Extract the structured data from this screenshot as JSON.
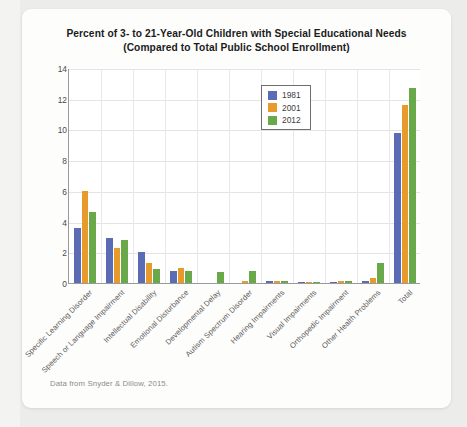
{
  "chart_data": {
    "type": "bar",
    "title": "Percent of 3- to 21-Year-Old Children with Special Educational Needs",
    "subtitle": "(Compared to Total Public School Enrollment)",
    "xlabel": "",
    "ylabel": "",
    "ylim": [
      0,
      14
    ],
    "yticks": [
      0,
      2,
      4,
      6,
      8,
      10,
      12,
      14
    ],
    "grid": true,
    "legend_position": "top-center",
    "categories": [
      "Specific Learning Disorder",
      "Speech or Language Impairment",
      "Intellectual Disability",
      "Emotional Disturbance",
      "Developmental Delay",
      "Autism Spectrum Disorder",
      "Hearing Impairments",
      "Visual Impairments",
      "Orthopedic Impairment",
      "Other Health Problems",
      "Total"
    ],
    "series": [
      {
        "name": "1981",
        "color": "#5b6cb5",
        "values": [
          3.6,
          2.9,
          2.0,
          0.75,
          0.0,
          0.0,
          0.15,
          0.08,
          0.08,
          0.15,
          9.8
        ]
      },
      {
        "name": "2001",
        "color": "#e89b2c",
        "values": [
          6.0,
          2.3,
          1.3,
          0.95,
          0.0,
          0.1,
          0.15,
          0.05,
          0.15,
          0.35,
          11.6
        ]
      },
      {
        "name": "2012",
        "color": "#6aa94a",
        "values": [
          4.6,
          2.8,
          0.9,
          0.8,
          0.7,
          0.8,
          0.15,
          0.08,
          0.1,
          1.3,
          12.7
        ]
      }
    ],
    "source_note": "Data from Snyder & Dillow, 2015."
  }
}
